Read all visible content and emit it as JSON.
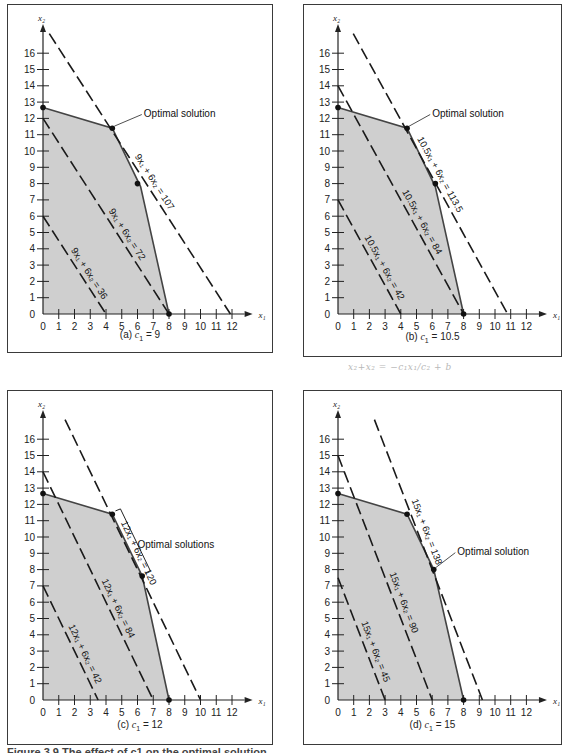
{
  "figure_caption": "Figure 3.9 The effect of c1 on the optimal solution",
  "handwritten_note": "x₂+x₂ =  −c₁x₁/c₂ + b",
  "colors": {
    "feasible_fill": "#cfcfcf",
    "edge": "#444444",
    "line": "#1a1a1a"
  },
  "chart_data": [
    {
      "type": "line",
      "panel": "a",
      "caption_prefix": "(a)",
      "caption_var": "c",
      "caption_sub": "1",
      "caption_value": "= 9",
      "xlabel": "x1",
      "ylabel": "x2",
      "xlim": [
        0,
        12
      ],
      "ylim": [
        0,
        16
      ],
      "xticks": [
        0,
        1,
        2,
        3,
        4,
        5,
        6,
        7,
        8,
        9,
        10,
        11,
        12
      ],
      "yticks": [
        0,
        1,
        2,
        3,
        4,
        5,
        6,
        7,
        8,
        9,
        10,
        11,
        12,
        13,
        14,
        15,
        16
      ],
      "feasible_region": [
        [
          0,
          0
        ],
        [
          0,
          12.67
        ],
        [
          4.4,
          11.4
        ],
        [
          6.2,
          7.8
        ],
        [
          8,
          0
        ]
      ],
      "vertices": [
        [
          0,
          12.67
        ],
        [
          4.4,
          11.4
        ],
        [
          6.0,
          8.0
        ],
        [
          8,
          0
        ]
      ],
      "iso_lines": [
        {
          "label": "9x₁ + 6x₂ = 36",
          "x_int": 4,
          "y_int": 6
        },
        {
          "label": "9x₁ + 6x₂ = 72",
          "x_int": 8,
          "y_int": 12
        },
        {
          "label": "9x₁ + 6x₂ = 107",
          "x_int": 11.9,
          "y_int": 17.8
        }
      ],
      "annotation": {
        "text": "Optimal solution",
        "point": [
          4.4,
          11.4
        ],
        "text_pos": [
          6.4,
          12.3
        ]
      }
    },
    {
      "type": "line",
      "panel": "b",
      "caption_prefix": "(b)",
      "caption_var": "c",
      "caption_sub": "1",
      "caption_value": "= 10.5",
      "xlabel": "x1",
      "ylabel": "x2",
      "xlim": [
        0,
        12
      ],
      "ylim": [
        0,
        16
      ],
      "xticks": [
        0,
        1,
        2,
        3,
        4,
        5,
        6,
        7,
        8,
        9,
        10,
        11,
        12
      ],
      "yticks": [
        0,
        1,
        2,
        3,
        4,
        5,
        6,
        7,
        8,
        9,
        10,
        11,
        12,
        13,
        14,
        15,
        16
      ],
      "feasible_region": [
        [
          0,
          0
        ],
        [
          0,
          12.67
        ],
        [
          4.4,
          11.4
        ],
        [
          6.2,
          7.8
        ],
        [
          8,
          0
        ]
      ],
      "vertices": [
        [
          0,
          12.67
        ],
        [
          4.4,
          11.4
        ],
        [
          6.2,
          8.0
        ],
        [
          8,
          0
        ]
      ],
      "iso_lines": [
        {
          "label": "10.5x₁ + 6x₂ = 42",
          "x_int": 4,
          "y_int": 7
        },
        {
          "label": "10.5x₁ + 6x₂ = 84",
          "x_int": 8,
          "y_int": 14
        },
        {
          "label": "10.5x₁ + 6x₂ = 113.5",
          "x_int": 10.8,
          "y_int": 18.9
        }
      ],
      "annotation": {
        "text": "Optimal solution",
        "point": [
          4.4,
          11.4
        ],
        "text_pos": [
          6.0,
          12.3
        ]
      }
    },
    {
      "type": "line",
      "panel": "c",
      "caption_prefix": "(c)",
      "caption_var": "c",
      "caption_sub": "1",
      "caption_value": "= 12",
      "xlabel": "x1",
      "ylabel": "x2",
      "xlim": [
        0,
        12
      ],
      "ylim": [
        0,
        16
      ],
      "xticks": [
        0,
        1,
        2,
        3,
        4,
        5,
        6,
        7,
        8,
        9,
        10,
        11,
        12
      ],
      "yticks": [
        0,
        1,
        2,
        3,
        4,
        5,
        6,
        7,
        8,
        9,
        10,
        11,
        12,
        13,
        14,
        15,
        16
      ],
      "feasible_region": [
        [
          0,
          0
        ],
        [
          0,
          12.67
        ],
        [
          4.4,
          11.4
        ],
        [
          6.3,
          7.6
        ],
        [
          8,
          0
        ]
      ],
      "vertices": [
        [
          0,
          12.67
        ],
        [
          4.4,
          11.4
        ],
        [
          6.3,
          7.6
        ],
        [
          8,
          0
        ]
      ],
      "iso_lines": [
        {
          "label": "12x₁ + 6x₂ = 42",
          "x_int": 3.5,
          "y_int": 7
        },
        {
          "label": "12x₁ + 6x₂ = 84",
          "x_int": 7,
          "y_int": 14
        },
        {
          "label": "12x₁ + 6x₂ = 120",
          "x_int": 10,
          "y_int": 20
        }
      ],
      "annotation": {
        "text": "Optimal solutions",
        "point": [
          5.5,
          9.5
        ],
        "text_pos": [
          6.0,
          9.5
        ],
        "bracket": [
          [
            4.6,
            11.6
          ],
          [
            6.5,
            7.8
          ]
        ]
      }
    },
    {
      "type": "line",
      "panel": "d",
      "caption_prefix": "(d)",
      "caption_var": "c",
      "caption_sub": "1",
      "caption_value": "= 15",
      "xlabel": "x1",
      "ylabel": "x2",
      "xlim": [
        0,
        12
      ],
      "ylim": [
        0,
        16
      ],
      "xticks": [
        0,
        1,
        2,
        3,
        4,
        5,
        6,
        7,
        8,
        9,
        10,
        11,
        12
      ],
      "yticks": [
        0,
        1,
        2,
        3,
        4,
        5,
        6,
        7,
        8,
        9,
        10,
        11,
        12,
        13,
        14,
        15,
        16
      ],
      "feasible_region": [
        [
          0,
          0
        ],
        [
          0,
          12.67
        ],
        [
          4.4,
          11.4
        ],
        [
          6.1,
          8.0
        ],
        [
          8,
          0
        ]
      ],
      "vertices": [
        [
          0,
          12.67
        ],
        [
          4.4,
          11.4
        ],
        [
          6.1,
          8.0
        ],
        [
          8,
          0
        ]
      ],
      "iso_lines": [
        {
          "label": "15x₁ + 6x₂ = 45",
          "x_int": 3,
          "y_int": 7.5
        },
        {
          "label": "15x₁ + 6x₂ = 90",
          "x_int": 6,
          "y_int": 15
        },
        {
          "label": "15x₁ + 6x₂ = 138",
          "x_int": 9.2,
          "y_int": 23
        }
      ],
      "annotation": {
        "text": "Optimal solution",
        "point": [
          6.1,
          8.0
        ],
        "text_pos": [
          7.6,
          9.1
        ]
      }
    }
  ]
}
